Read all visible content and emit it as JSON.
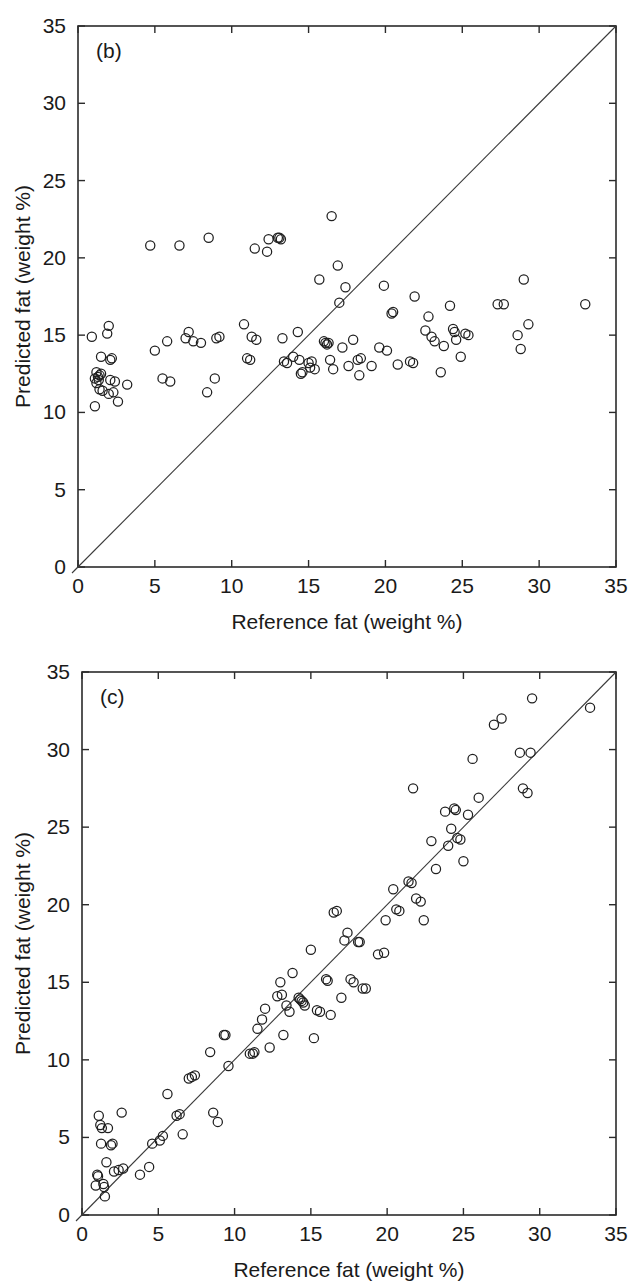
{
  "figure": {
    "panels": [
      "b",
      "c"
    ]
  },
  "chart_data": [
    {
      "type": "scatter",
      "panel_label": "(b)",
      "title": "",
      "xlabel": "Reference fat (weight %)",
      "ylabel": "Predicted fat (weight %)",
      "xlim": [
        0,
        35
      ],
      "ylim": [
        0,
        35
      ],
      "xticks": [
        0,
        5,
        10,
        15,
        20,
        25,
        30,
        35
      ],
      "yticks": [
        0,
        5,
        10,
        15,
        20,
        25,
        30,
        35
      ],
      "grid": false,
      "legend": null,
      "reference_line": {
        "type": "identity",
        "from": [
          0,
          0
        ],
        "to": [
          35,
          35
        ],
        "label": "1:1 line"
      },
      "marker": {
        "shape": "open-circle",
        "radius_px": 4.6,
        "color": "#1f1f1f"
      },
      "points": [
        [
          0.9,
          14.9
        ],
        [
          1.1,
          12.2
        ],
        [
          1.2,
          12.6
        ],
        [
          1.3,
          12.3
        ],
        [
          1.4,
          12.4
        ],
        [
          1.35,
          12.1
        ],
        [
          1.5,
          12.5
        ],
        [
          1.2,
          11.9
        ],
        [
          1.4,
          11.5
        ],
        [
          1.6,
          11.4
        ],
        [
          1.1,
          10.4
        ],
        [
          1.5,
          13.6
        ],
        [
          1.9,
          15.1
        ],
        [
          2.0,
          15.6
        ],
        [
          2.1,
          13.4
        ],
        [
          2.2,
          13.5
        ],
        [
          2.1,
          12.1
        ],
        [
          2.3,
          11.3
        ],
        [
          2.0,
          11.2
        ],
        [
          2.6,
          10.7
        ],
        [
          2.4,
          12.0
        ],
        [
          3.2,
          11.8
        ],
        [
          4.7,
          20.8
        ],
        [
          5.0,
          14.0
        ],
        [
          5.5,
          12.2
        ],
        [
          5.8,
          14.6
        ],
        [
          6.0,
          12.0
        ],
        [
          6.6,
          20.8
        ],
        [
          7.0,
          14.8
        ],
        [
          7.2,
          15.2
        ],
        [
          7.5,
          14.6
        ],
        [
          8.0,
          14.5
        ],
        [
          8.5,
          21.3
        ],
        [
          8.4,
          11.3
        ],
        [
          8.9,
          12.2
        ],
        [
          9.0,
          14.8
        ],
        [
          9.2,
          14.9
        ],
        [
          10.8,
          15.7
        ],
        [
          11.0,
          13.5
        ],
        [
          11.2,
          13.4
        ],
        [
          11.3,
          14.9
        ],
        [
          11.6,
          14.7
        ],
        [
          11.5,
          20.6
        ],
        [
          12.3,
          20.4
        ],
        [
          12.4,
          21.2
        ],
        [
          13.0,
          21.3
        ],
        [
          13.1,
          21.3
        ],
        [
          13.2,
          21.2
        ],
        [
          13.3,
          14.8
        ],
        [
          13.4,
          13.3
        ],
        [
          13.6,
          13.2
        ],
        [
          14.0,
          13.6
        ],
        [
          14.3,
          15.2
        ],
        [
          14.4,
          13.4
        ],
        [
          14.6,
          12.6
        ],
        [
          14.5,
          12.5
        ],
        [
          15.0,
          13.2
        ],
        [
          15.1,
          12.9
        ],
        [
          15.2,
          13.3
        ],
        [
          15.4,
          12.8
        ],
        [
          15.7,
          18.6
        ],
        [
          16.0,
          14.6
        ],
        [
          16.1,
          14.5
        ],
        [
          16.2,
          14.4
        ],
        [
          16.3,
          14.5
        ],
        [
          16.4,
          13.4
        ],
        [
          16.5,
          22.7
        ],
        [
          16.6,
          12.8
        ],
        [
          16.9,
          19.5
        ],
        [
          17.0,
          17.1
        ],
        [
          17.2,
          14.2
        ],
        [
          17.4,
          18.1
        ],
        [
          17.6,
          13.0
        ],
        [
          17.9,
          14.7
        ],
        [
          18.2,
          13.4
        ],
        [
          18.4,
          13.5
        ],
        [
          18.3,
          12.4
        ],
        [
          19.1,
          13.0
        ],
        [
          19.6,
          14.2
        ],
        [
          19.9,
          18.2
        ],
        [
          20.1,
          14.0
        ],
        [
          20.4,
          16.4
        ],
        [
          20.5,
          16.5
        ],
        [
          20.8,
          13.1
        ],
        [
          21.6,
          13.3
        ],
        [
          21.8,
          13.2
        ],
        [
          21.9,
          17.5
        ],
        [
          22.6,
          15.3
        ],
        [
          22.8,
          16.2
        ],
        [
          23.0,
          14.9
        ],
        [
          23.2,
          14.6
        ],
        [
          23.6,
          12.6
        ],
        [
          23.8,
          14.3
        ],
        [
          24.2,
          16.9
        ],
        [
          24.4,
          15.4
        ],
        [
          24.5,
          15.2
        ],
        [
          24.6,
          14.7
        ],
        [
          24.9,
          13.6
        ],
        [
          25.2,
          15.1
        ],
        [
          25.4,
          15.0
        ],
        [
          27.3,
          17.0
        ],
        [
          27.7,
          17.0
        ],
        [
          28.6,
          15.0
        ],
        [
          28.8,
          14.1
        ],
        [
          29.0,
          18.6
        ],
        [
          29.3,
          15.7
        ],
        [
          33.0,
          17.0
        ]
      ]
    },
    {
      "type": "scatter",
      "panel_label": "(c)",
      "title": "",
      "xlabel": "Reference fat (weight %)",
      "ylabel": "Predicted fat (weight %)",
      "xlim": [
        0,
        35
      ],
      "ylim": [
        0,
        35
      ],
      "xticks": [
        0,
        5,
        10,
        15,
        20,
        25,
        30,
        35
      ],
      "yticks": [
        0,
        5,
        10,
        15,
        20,
        25,
        30,
        35
      ],
      "grid": false,
      "legend": null,
      "reference_line": {
        "type": "identity",
        "from": [
          0,
          0
        ],
        "to": [
          35,
          35
        ],
        "label": "1:1 line"
      },
      "marker": {
        "shape": "open-circle",
        "radius_px": 4.6,
        "color": "#1f1f1f"
      },
      "points": [
        [
          0.9,
          1.9
        ],
        [
          1.0,
          2.6
        ],
        [
          1.05,
          2.5
        ],
        [
          1.1,
          6.4
        ],
        [
          1.2,
          5.8
        ],
        [
          1.3,
          5.6
        ],
        [
          1.25,
          4.6
        ],
        [
          1.4,
          2.0
        ],
        [
          1.45,
          1.8
        ],
        [
          1.5,
          1.2
        ],
        [
          1.6,
          3.4
        ],
        [
          1.7,
          5.6
        ],
        [
          1.9,
          4.5
        ],
        [
          2.0,
          4.6
        ],
        [
          2.1,
          2.8
        ],
        [
          2.4,
          2.9
        ],
        [
          2.6,
          6.6
        ],
        [
          2.7,
          3.0
        ],
        [
          3.8,
          2.6
        ],
        [
          4.4,
          3.1
        ],
        [
          4.6,
          4.6
        ],
        [
          5.1,
          4.8
        ],
        [
          5.3,
          5.1
        ],
        [
          5.6,
          7.8
        ],
        [
          6.2,
          6.4
        ],
        [
          6.4,
          6.5
        ],
        [
          6.6,
          5.2
        ],
        [
          7.0,
          8.8
        ],
        [
          7.2,
          8.9
        ],
        [
          7.4,
          9.0
        ],
        [
          8.4,
          10.5
        ],
        [
          8.6,
          6.6
        ],
        [
          8.9,
          6.0
        ],
        [
          9.3,
          11.6
        ],
        [
          9.4,
          11.6
        ],
        [
          9.6,
          9.6
        ],
        [
          11.0,
          10.4
        ],
        [
          11.2,
          10.4
        ],
        [
          11.3,
          10.5
        ],
        [
          11.5,
          12.0
        ],
        [
          11.8,
          12.6
        ],
        [
          12.0,
          13.3
        ],
        [
          12.3,
          10.8
        ],
        [
          12.8,
          14.1
        ],
        [
          13.0,
          15.0
        ],
        [
          13.1,
          14.2
        ],
        [
          13.2,
          11.6
        ],
        [
          13.4,
          13.5
        ],
        [
          13.6,
          13.1
        ],
        [
          13.8,
          15.6
        ],
        [
          14.2,
          14.0
        ],
        [
          14.3,
          13.9
        ],
        [
          14.4,
          13.8
        ],
        [
          14.5,
          13.7
        ],
        [
          14.6,
          13.5
        ],
        [
          15.0,
          17.1
        ],
        [
          15.2,
          11.4
        ],
        [
          15.4,
          13.2
        ],
        [
          15.6,
          13.1
        ],
        [
          16.0,
          15.2
        ],
        [
          16.1,
          15.1
        ],
        [
          16.3,
          12.9
        ],
        [
          16.5,
          19.5
        ],
        [
          16.7,
          19.6
        ],
        [
          17.0,
          14.0
        ],
        [
          17.2,
          17.7
        ],
        [
          17.4,
          18.2
        ],
        [
          17.6,
          15.2
        ],
        [
          17.8,
          15.0
        ],
        [
          18.1,
          17.6
        ],
        [
          18.2,
          17.6
        ],
        [
          18.4,
          14.6
        ],
        [
          18.6,
          14.6
        ],
        [
          19.4,
          16.8
        ],
        [
          19.8,
          16.9
        ],
        [
          19.9,
          19.0
        ],
        [
          20.4,
          21.0
        ],
        [
          20.6,
          19.7
        ],
        [
          20.8,
          19.6
        ],
        [
          21.4,
          21.5
        ],
        [
          21.6,
          21.4
        ],
        [
          21.7,
          27.5
        ],
        [
          21.9,
          20.4
        ],
        [
          22.2,
          20.2
        ],
        [
          22.4,
          19.0
        ],
        [
          22.9,
          24.1
        ],
        [
          23.2,
          22.3
        ],
        [
          23.8,
          26.0
        ],
        [
          24.0,
          23.8
        ],
        [
          24.2,
          24.9
        ],
        [
          24.4,
          26.2
        ],
        [
          24.5,
          26.1
        ],
        [
          24.6,
          24.3
        ],
        [
          24.8,
          24.2
        ],
        [
          25.0,
          22.8
        ],
        [
          25.3,
          25.8
        ],
        [
          25.6,
          29.4
        ],
        [
          26.0,
          26.9
        ],
        [
          27.0,
          31.6
        ],
        [
          27.5,
          32.0
        ],
        [
          28.7,
          29.8
        ],
        [
          28.9,
          27.5
        ],
        [
          29.2,
          27.2
        ],
        [
          29.4,
          29.8
        ],
        [
          29.5,
          33.3
        ],
        [
          33.3,
          32.7
        ]
      ]
    }
  ]
}
